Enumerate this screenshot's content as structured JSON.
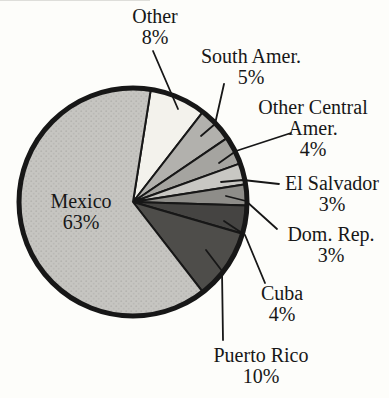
{
  "page": {
    "background": "#fdfdfa"
  },
  "chart_data": {
    "type": "pie",
    "title": "",
    "legend": "none",
    "grid": "off",
    "start_angle_deg": 9,
    "clockwise": true,
    "center": {
      "x": 133,
      "y": 202
    },
    "radius": 114,
    "outline_color": "#171717",
    "rim_stroke_width": 5,
    "slice_stroke_width": 2,
    "leader_stroke_width": 1.8,
    "label_color": "#171717",
    "slices": [
      {
        "label": "Other",
        "value_pct": 8,
        "color": "#f3f2ec",
        "label_lines": [
          "Other",
          "8%"
        ],
        "label_pos": {
          "x": 155,
          "y": 6
        },
        "leader": [
          [
            178,
            109
          ],
          [
            153,
            51
          ]
        ]
      },
      {
        "label": "South Amer.",
        "value_pct": 5,
        "color": "#b2b1ad",
        "label_lines": [
          "South Amer.",
          "5%"
        ],
        "label_pos": {
          "x": 251,
          "y": 46
        },
        "leader": [
          [
            201,
            136
          ],
          [
            215,
            124
          ],
          [
            224,
            84
          ]
        ]
      },
      {
        "label": "Other Central Amer.",
        "value_pct": 4,
        "color": "#a5a4a0",
        "label_lines": [
          "Other Central",
          "Amer.",
          "4%"
        ],
        "label_pos": {
          "x": 313,
          "y": 97
        },
        "leader": [
          [
            219,
            163
          ],
          [
            236,
            151
          ],
          [
            291,
            133
          ]
        ]
      },
      {
        "label": "El Salvador",
        "value_pct": 3,
        "color": "#c8c7c3",
        "label_lines": [
          "El Salvador",
          "3%"
        ],
        "label_pos": {
          "x": 332,
          "y": 173
        },
        "leader": [
          [
            221,
            182
          ],
          [
            243,
            180
          ],
          [
            279,
            184
          ]
        ]
      },
      {
        "label": "Dom. Rep.",
        "value_pct": 3,
        "color": "#8e8d89",
        "label_lines": [
          "Dom. Rep.",
          "3%"
        ],
        "label_pos": {
          "x": 331,
          "y": 224
        },
        "leader": [
          [
            226,
            196
          ],
          [
            246,
            201
          ],
          [
            277,
            229
          ]
        ]
      },
      {
        "label": "Cuba",
        "value_pct": 4,
        "color": "#454442",
        "label_lines": [
          "Cuba",
          "4%"
        ],
        "label_pos": {
          "x": 282,
          "y": 283
        },
        "leader": [
          [
            224,
            221
          ],
          [
            245,
            235
          ],
          [
            265,
            283
          ]
        ]
      },
      {
        "label": "Puerto Rico",
        "value_pct": 10,
        "color": "#4e4d4a",
        "label_lines": [
          "Puerto Rico",
          "10%"
        ],
        "label_pos": {
          "x": 261,
          "y": 345
        },
        "leader": [
          [
            206,
            250
          ],
          [
            222,
            271
          ],
          [
            223,
            340
          ]
        ]
      },
      {
        "label": "Mexico",
        "value_pct": 63,
        "color": "#c6c5c1",
        "texture": "halftone-dots",
        "label_lines": [
          "Mexico",
          "63%"
        ],
        "label_pos": {
          "x": 81,
          "y": 191
        },
        "label_inside": true,
        "leader": null
      }
    ]
  }
}
